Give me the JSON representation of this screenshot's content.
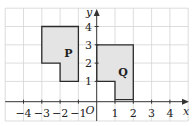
{
  "diagram": {
    "type": "coordinate-grid",
    "axes": {
      "x_label": "x",
      "y_label": "y",
      "origin_label": "O",
      "x_range": [
        -5,
        5
      ],
      "y_range": [
        -0.5,
        5
      ],
      "x_ticks": [
        {
          "value": -4,
          "label": "−4"
        },
        {
          "value": -3,
          "label": "−3"
        },
        {
          "value": -2,
          "label": "−2"
        },
        {
          "value": -1,
          "label": "−1"
        },
        {
          "value": 1,
          "label": "1"
        },
        {
          "value": 2,
          "label": "2"
        },
        {
          "value": 3,
          "label": "3"
        },
        {
          "value": 4,
          "label": "4"
        }
      ],
      "y_ticks": [
        {
          "value": 1,
          "label": "1"
        },
        {
          "value": 2,
          "label": "2"
        },
        {
          "value": 3,
          "label": "3"
        },
        {
          "value": 4,
          "label": "4"
        }
      ]
    },
    "shapes": [
      {
        "name": "P",
        "label": "P",
        "vertices": [
          [
            -3,
            4
          ],
          [
            -1,
            4
          ],
          [
            -1,
            1
          ],
          [
            -2,
            1
          ],
          [
            -2,
            2
          ],
          [
            -3,
            2
          ]
        ],
        "fill": "#e4e4e4"
      },
      {
        "name": "Q",
        "label": "Q",
        "vertices": [
          [
            0,
            3
          ],
          [
            2,
            3
          ],
          [
            2,
            0
          ],
          [
            1,
            0
          ],
          [
            1,
            1
          ],
          [
            0,
            1
          ]
        ],
        "fill": "#e4e4e4"
      }
    ]
  }
}
